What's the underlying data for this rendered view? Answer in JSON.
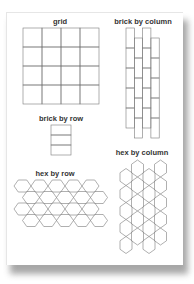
{
  "labels": {
    "grid": "grid",
    "brick_by_column": "brick by column",
    "brick_by_row": "brick by row",
    "hex_by_row": "hex by row",
    "hex_by_column": "hex by column"
  },
  "colors": {
    "stroke": "#7a7a7a",
    "text": "#333333",
    "page": "#ffffff",
    "shadow": "#8a8a8a"
  },
  "patterns": {
    "grid": {
      "cols": 4,
      "rows": 4
    },
    "brick_by_column": {
      "cols": 4
    },
    "brick_by_row": {
      "rows": 3
    },
    "hex_by_row": {
      "rows": 4,
      "per_row": 5
    },
    "hex_by_column": {
      "cols": 4
    }
  }
}
